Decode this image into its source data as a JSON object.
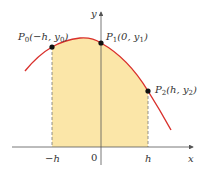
{
  "figure": {
    "axes": {
      "x_label": "x",
      "y_label": "y",
      "ticks": [
        {
          "label": "−h",
          "x": 52
        },
        {
          "label": "0",
          "x": 94
        },
        {
          "label": "h",
          "x": 148
        }
      ]
    },
    "points": [
      {
        "name": "P0",
        "label_main": "P",
        "label_sub": "0",
        "label_rest": "(−h, y",
        "label_sub2": "0",
        "label_end": ")",
        "cx": 52,
        "cy": 47
      },
      {
        "name": "P1",
        "label_main": "P",
        "label_sub": "1",
        "label_rest": "(0, y",
        "label_sub2": "1",
        "label_end": ")",
        "cx": 101,
        "cy": 43
      },
      {
        "name": "P2",
        "label_main": "P",
        "label_sub": "2",
        "label_rest": "(h, y",
        "label_sub2": "2",
        "label_end": ")",
        "cx": 148,
        "cy": 91
      }
    ],
    "colors": {
      "curve": "#d9302c",
      "fill": "#fbe6a8",
      "axis": "#555555",
      "point": "#111111",
      "dash": "#777777"
    }
  }
}
